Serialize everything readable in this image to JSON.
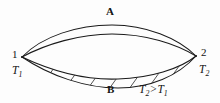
{
  "figure": {
    "type": "thermodynamic-cycle-lens-diagram",
    "background_color": "#fdfdfd",
    "stroke_color": "#1a1a1a",
    "hatch_color": "#2a2a2a",
    "labels": {
      "path_upper": "A",
      "path_lower": "B",
      "state_left": "1",
      "state_right": "2",
      "temp_left_main": "T",
      "temp_left_sub": "1",
      "temp_right_main": "T",
      "temp_right_sub": "2",
      "inequality_left_main": "T",
      "inequality_left_sub": "2",
      "inequality_operator": ">",
      "inequality_right_main": "T",
      "inequality_right_sub": "1"
    },
    "geometry": {
      "vertex_left": [
        22,
        57
      ],
      "vertex_right": [
        196,
        56
      ],
      "curve_a_outer_apex_y": 25,
      "curve_a_inner_apex_y": 33,
      "curve_b_inner_apex_y": 72,
      "curve_b_outer_apex_y": 80,
      "hatched_band": "lower",
      "hatch_angle_deg": 35,
      "hatch_count": 9
    }
  }
}
